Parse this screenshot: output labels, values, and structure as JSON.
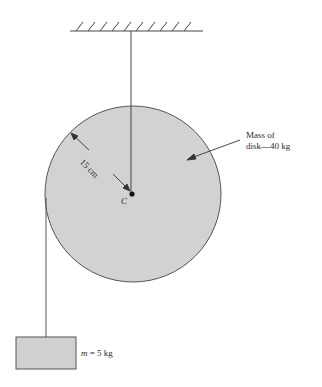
{
  "diagram": {
    "disk": {
      "center_label": "C",
      "radius_label": "15 cm",
      "mass_label_line1": "Mass of",
      "mass_label_line2": "disk—40 kg",
      "fill": "#d2d2d2",
      "stroke": "#555555"
    },
    "block": {
      "mass_symbol": "m",
      "mass_value": " = 5 kg",
      "fill": "#d0d0d0"
    },
    "ceiling": {
      "hatch_count": 10
    }
  }
}
